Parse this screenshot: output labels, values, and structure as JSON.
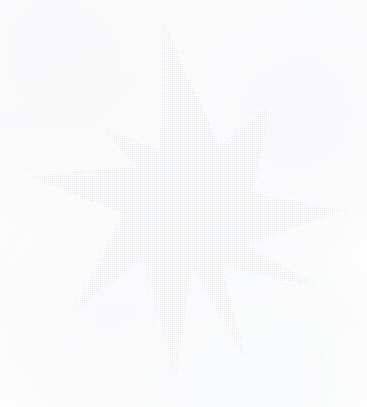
{
  "canvas": {
    "width": 367,
    "height": 407,
    "background_color": "#fdfdfd",
    "paper_tint_color": "#f7f7f9"
  },
  "artwork": {
    "name": "halftone-star",
    "subject": "nine-pointed star",
    "style": "halftone dot screen",
    "ink_color": "#d8dade",
    "ink_color_light": "#e6e8ec",
    "dot_pitch_px": 2,
    "dot_size_px": 1,
    "rotation_deg": -4,
    "opacity": 0.85,
    "point_count": 9,
    "center": {
      "x": 186,
      "y": 205
    },
    "outer_radius_px": 160,
    "inner_radius_px": 62,
    "tips": [
      {
        "label": "north",
        "x": 163,
        "y": 20
      },
      {
        "label": "north-east",
        "x": 271,
        "y": 104
      },
      {
        "label": "east",
        "x": 341,
        "y": 210
      },
      {
        "label": "south-east",
        "x": 321,
        "y": 288
      },
      {
        "label": "south",
        "x": 246,
        "y": 360
      },
      {
        "label": "south-south-west",
        "x": 176,
        "y": 377
      },
      {
        "label": "south-west",
        "x": 75,
        "y": 311
      },
      {
        "label": "west",
        "x": 30,
        "y": 176
      },
      {
        "label": "north-west",
        "x": 104,
        "y": 129
      }
    ],
    "notches": [
      {
        "label": "notch-n-ne",
        "x": 219,
        "y": 146
      },
      {
        "label": "notch-ne-e",
        "x": 252,
        "y": 192
      },
      {
        "label": "notch-e-se",
        "x": 247,
        "y": 245
      },
      {
        "label": "notch-se-s",
        "x": 222,
        "y": 266
      },
      {
        "label": "notch-s-ssw",
        "x": 192,
        "y": 268
      },
      {
        "label": "notch-ssw-sw",
        "x": 143,
        "y": 258
      },
      {
        "label": "notch-sw-w",
        "x": 123,
        "y": 214
      },
      {
        "label": "notch-w-nw",
        "x": 135,
        "y": 167
      },
      {
        "label": "notch-nw-n",
        "x": 160,
        "y": 150
      }
    ]
  }
}
